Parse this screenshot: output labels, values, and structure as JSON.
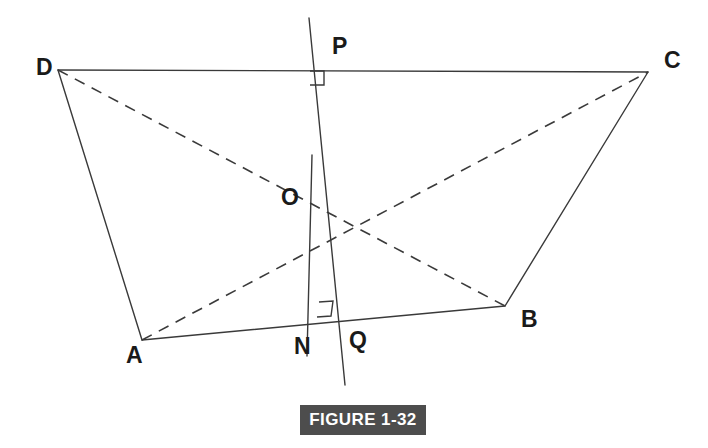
{
  "figure": {
    "caption": "FIGURE 1-32",
    "caption_bar_color": "#4d4d4d",
    "caption_text_color": "#ffffff",
    "background_color": "#ffffff",
    "stroke_color": "#3a3a3a",
    "label_color": "#1a1a1a",
    "width": 708,
    "height": 448
  },
  "points": {
    "A": {
      "label": "A",
      "x": 142,
      "y": 340,
      "label_x": 126,
      "label_y": 357
    },
    "B": {
      "label": "B",
      "x": 505,
      "y": 306,
      "label_x": 521,
      "label_y": 321
    },
    "C": {
      "label": "C",
      "x": 648,
      "y": 72,
      "label_x": 664,
      "label_y": 62
    },
    "D": {
      "label": "D",
      "x": 58,
      "y": 70,
      "label_x": 36,
      "label_y": 69
    },
    "O": {
      "label": "O",
      "x": 310,
      "y": 198,
      "label_x": 281,
      "label_y": 199
    },
    "P": {
      "label": "P",
      "x": 309,
      "y": 18,
      "label_x": 332,
      "label_y": 48
    },
    "N": {
      "label": "N",
      "x": 307,
      "y": 352,
      "label_x": 294,
      "label_y": 348
    },
    "Q": {
      "label": "Q",
      "x": 330,
      "y": 325,
      "label_x": 349,
      "label_y": 342
    }
  },
  "solid_segments": [
    {
      "name": "side-DC",
      "x1": 58,
      "y1": 70,
      "x2": 648,
      "y2": 72
    },
    {
      "name": "side-DA",
      "x1": 58,
      "y1": 70,
      "x2": 142,
      "y2": 340
    },
    {
      "name": "side-AB",
      "x1": 142,
      "y1": 340,
      "x2": 505,
      "y2": 306
    },
    {
      "name": "side-CB",
      "x1": 648,
      "y1": 72,
      "x2": 505,
      "y2": 306
    },
    {
      "name": "line-PQ",
      "x1": 309,
      "y1": 18,
      "x2": 345,
      "y2": 385
    },
    {
      "name": "line-ON",
      "x1": 312,
      "y1": 155,
      "x2": 307,
      "y2": 356
    }
  ],
  "dashed_segments": [
    {
      "name": "diagonal-DB",
      "x1": 58,
      "y1": 70,
      "x2": 505,
      "y2": 306
    },
    {
      "name": "diagonal-AC",
      "x1": 142,
      "y1": 340,
      "x2": 648,
      "y2": 72
    }
  ],
  "right_angle_marks": [
    {
      "name": "right-angle-at-P-on-DC",
      "points": "310,71 324,71 324,85 310,85"
    },
    {
      "name": "right-angle-at-Q-on-AB",
      "points": "317,317 331,316 333,301 319,302"
    }
  ],
  "dash_pattern": "11 8",
  "stroke_width": 1.4,
  "caption_box": {
    "left": 300,
    "top": 405,
    "width": 126,
    "height": 30
  }
}
